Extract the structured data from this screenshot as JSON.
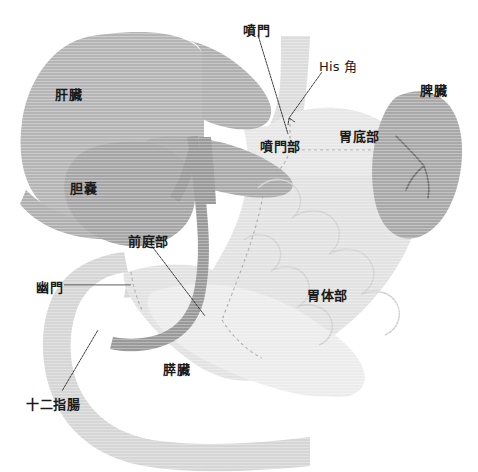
{
  "figure": {
    "width": 478,
    "height": 472,
    "background_color": "#ffffff"
  },
  "colors": {
    "liver": "#b5b5b5",
    "liver_lobe": "#aeaeae",
    "gallbladder": "#a6a6a6",
    "esophagus": "#a8a8a8",
    "spleen": "#a9a9a9",
    "stomach": "#e2e2e2",
    "stomach_fundus": "#e6e6e6",
    "duodenum": "#d7d7d7",
    "pancreas": "#ebebeb",
    "bile_duct": "#9a9a9a",
    "dashed_divider": "#b0b0b0",
    "leader_line": "#333333",
    "label_text": "#1a1a1a"
  },
  "labels": [
    {
      "id": "liver",
      "text": "肝臓",
      "x": 55,
      "y": 88,
      "has_leader": false,
      "script": "cjk"
    },
    {
      "id": "gallbladder",
      "text": "胆嚢",
      "x": 70,
      "y": 182,
      "has_leader": false,
      "script": "cjk"
    },
    {
      "id": "cardia",
      "text": "噴門",
      "x": 243,
      "y": 24,
      "has_leader": true,
      "script": "cjk"
    },
    {
      "id": "his-angle",
      "text": "His 角",
      "x": 319,
      "y": 60,
      "has_leader": true,
      "script": "latin"
    },
    {
      "id": "spleen",
      "text": "脾臓",
      "x": 420,
      "y": 84,
      "has_leader": false,
      "script": "cjk"
    },
    {
      "id": "cardia-region",
      "text": "噴門部",
      "x": 260,
      "y": 140,
      "has_leader": false,
      "script": "cjk"
    },
    {
      "id": "fundus",
      "text": "胃底部",
      "x": 339,
      "y": 130,
      "has_leader": false,
      "script": "cjk"
    },
    {
      "id": "antrum",
      "text": "前庭部",
      "x": 128,
      "y": 235,
      "has_leader": true,
      "script": "cjk"
    },
    {
      "id": "pylorus",
      "text": "幽門",
      "x": 36,
      "y": 281,
      "has_leader": true,
      "script": "cjk"
    },
    {
      "id": "body",
      "text": "胃体部",
      "x": 307,
      "y": 289,
      "has_leader": false,
      "script": "cjk"
    },
    {
      "id": "pancreas",
      "text": "膵臓",
      "x": 163,
      "y": 363,
      "has_leader": false,
      "script": "cjk"
    },
    {
      "id": "duodenum",
      "text": "十二指腸",
      "x": 26,
      "y": 398,
      "has_leader": true,
      "script": "cjk"
    }
  ],
  "leader_lines": [
    {
      "id": "cardia-leader",
      "x1": 258,
      "y1": 35,
      "x2": 288,
      "y2": 134
    },
    {
      "id": "his-angle-leader",
      "x1": 322,
      "y1": 72,
      "x2": 289,
      "y2": 118
    },
    {
      "id": "antrum-leader",
      "x1": 151,
      "y1": 245,
      "x2": 205,
      "y2": 316
    },
    {
      "id": "pylorus-leader",
      "x1": 64,
      "y1": 285,
      "x2": 131,
      "y2": 285
    },
    {
      "id": "duodenum-leader",
      "x1": 62,
      "y1": 391,
      "x2": 98,
      "y2": 330
    }
  ],
  "organs": [
    {
      "id": "liver",
      "name": "肝臓",
      "label": "liver"
    },
    {
      "id": "gallbladder",
      "name": "胆嚢",
      "label": "gallbladder"
    },
    {
      "id": "esophagus",
      "name": "食道",
      "label": "esophagus"
    },
    {
      "id": "stomach",
      "name": "胃",
      "label": "stomach"
    },
    {
      "id": "spleen",
      "name": "脾臓",
      "label": "spleen"
    },
    {
      "id": "duodenum",
      "name": "十二指腸",
      "label": "duodenum"
    },
    {
      "id": "pancreas",
      "name": "膵臓",
      "label": "pancreas"
    },
    {
      "id": "bile-duct",
      "name": "胆管",
      "label": "bile-duct"
    }
  ]
}
